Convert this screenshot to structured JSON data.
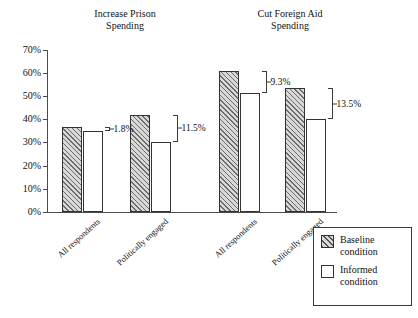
{
  "chart_data": {
    "type": "bar",
    "title": "",
    "xlabel": "",
    "ylabel": "",
    "ylim": [
      0,
      70
    ],
    "ytick_labels": [
      "0%",
      "10%",
      "20%",
      "30%",
      "40%",
      "50%",
      "60%",
      "70%"
    ],
    "ytick_values": [
      0,
      10,
      20,
      30,
      40,
      50,
      60,
      70
    ],
    "grid": false,
    "legend_position": "bottom-right",
    "panels": [
      {
        "title": "Increase Prison\nSpending",
        "categories": [
          "All respondents",
          "Politically engaged"
        ],
        "series": [
          {
            "name": "Baseline condition",
            "values": [
              36.7,
              41.8
            ]
          },
          {
            "name": "Informed condition",
            "values": [
              34.9,
              30.3
            ]
          }
        ],
        "annotations": [
          "1.8%",
          "11.5%"
        ]
      },
      {
        "title": "Cut Foreign Aid\nSpending",
        "categories": [
          "All respondents",
          "Politically engaged"
        ],
        "series": [
          {
            "name": "Baseline condition",
            "values": [
              60.8,
              53.5
            ]
          },
          {
            "name": "Informed condition",
            "values": [
              51.5,
              40.0
            ]
          }
        ],
        "annotations": [
          "9.3%",
          "13.5%"
        ]
      }
    ],
    "legend": [
      {
        "label": "Baseline\ncondition",
        "pattern": "diagonal-hatch",
        "color": "#d8d8d8"
      },
      {
        "label": "Informed\ncondition",
        "pattern": "solid",
        "color": "#ffffff"
      }
    ]
  },
  "axis": {
    "ticks": [
      {
        "label": "70%",
        "value": 70
      },
      {
        "label": "60%",
        "value": 60
      },
      {
        "label": "50%",
        "value": 50
      },
      {
        "label": "40%",
        "value": 40
      },
      {
        "label": "30%",
        "value": 30
      },
      {
        "label": "20%",
        "value": 20
      },
      {
        "label": "10%",
        "value": 10
      },
      {
        "label": "0%",
        "value": 0
      }
    ]
  },
  "panel_titles": {
    "prison": "Increase Prison\nSpending",
    "aid": "Cut Foreign Aid\nSpending"
  },
  "category_labels": {
    "g1": "All respondents",
    "g2": "Politically engaged",
    "g3": "All respondents",
    "g4": "Politically engaged"
  },
  "difference_labels": {
    "g1": "1.8%",
    "g2": "11.5%",
    "g3": "9.3%",
    "g4": "13.5%"
  },
  "legend": {
    "baseline": "Baseline\ncondition",
    "informed": "Informed\ncondition"
  },
  "colors": {
    "baseline_fill": "#d8d8d8",
    "informed_fill": "#ffffff",
    "outline": "#333333",
    "axis": "#4a4a4a"
  }
}
